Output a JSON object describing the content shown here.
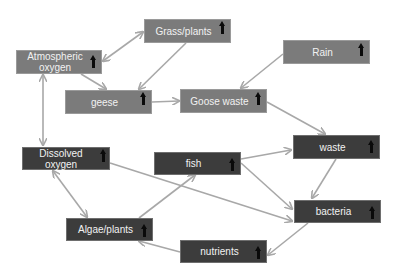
{
  "diagram": {
    "type": "ecosystem-flow",
    "colors": {
      "light_node": "#7b7b7b",
      "dark_node": "#3c3c3c",
      "edge": "#a8a8a8",
      "text": "#f2f2f2",
      "trend_arrow": "#0a0a0a"
    },
    "nodes": [
      {
        "id": "atmospheric_oxygen",
        "label": "Atmospheric oxygen",
        "trend": "up",
        "style": "light"
      },
      {
        "id": "grass_plants",
        "label": "Grass/plants",
        "trend": "up",
        "style": "light"
      },
      {
        "id": "rain",
        "label": "Rain",
        "trend": "up",
        "style": "light"
      },
      {
        "id": "geese",
        "label": "geese",
        "trend": "up",
        "style": "light"
      },
      {
        "id": "goose_waste",
        "label": "Goose waste",
        "trend": "up",
        "style": "light"
      },
      {
        "id": "dissolved_oxygen",
        "label": "Dissolved oxygen",
        "trend": "up",
        "style": "dark"
      },
      {
        "id": "fish",
        "label": "fish",
        "trend": "up",
        "style": "dark"
      },
      {
        "id": "waste",
        "label": "waste",
        "trend": "up",
        "style": "dark"
      },
      {
        "id": "bacteria",
        "label": "bacteria",
        "trend": "up",
        "style": "dark"
      },
      {
        "id": "algae_plants",
        "label": "Algae/plants",
        "trend": "up",
        "style": "dark"
      },
      {
        "id": "nutrients",
        "label": "nutrients",
        "trend": "up",
        "style": "dark"
      }
    ],
    "edges": [
      {
        "from": "atmospheric_oxygen",
        "to": "grass_plants",
        "bidirectional": true
      },
      {
        "from": "grass_plants",
        "to": "geese",
        "bidirectional": false
      },
      {
        "from": "atmospheric_oxygen",
        "to": "geese",
        "bidirectional": false
      },
      {
        "from": "geese",
        "to": "goose_waste",
        "bidirectional": false
      },
      {
        "from": "rain",
        "to": "goose_waste",
        "bidirectional": false
      },
      {
        "from": "goose_waste",
        "to": "waste",
        "bidirectional": false
      },
      {
        "from": "atmospheric_oxygen",
        "to": "dissolved_oxygen",
        "bidirectional": true
      },
      {
        "from": "dissolved_oxygen",
        "to": "algae_plants",
        "bidirectional": true
      },
      {
        "from": "dissolved_oxygen",
        "to": "bacteria",
        "bidirectional": false
      },
      {
        "from": "algae_plants",
        "to": "fish",
        "bidirectional": false
      },
      {
        "from": "fish",
        "to": "waste",
        "bidirectional": false
      },
      {
        "from": "fish",
        "to": "bacteria",
        "bidirectional": false
      },
      {
        "from": "waste",
        "to": "bacteria",
        "bidirectional": false
      },
      {
        "from": "bacteria",
        "to": "nutrients",
        "bidirectional": false
      },
      {
        "from": "nutrients",
        "to": "algae_plants",
        "bidirectional": false
      }
    ]
  }
}
